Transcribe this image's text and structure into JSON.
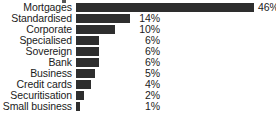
{
  "chart_data": {
    "type": "bar",
    "orientation": "horizontal",
    "title": "",
    "xlabel": "",
    "ylabel": "",
    "grid": false,
    "legend": null,
    "axis_visible": false,
    "value_suffix": "%",
    "xlim": [
      0,
      46
    ],
    "categories": [
      "Mortgages",
      "Standardised",
      "Corporate",
      "Specialised",
      "Sovereign",
      "Bank",
      "Business",
      "Credit cards",
      "Securitisation",
      "Small business"
    ],
    "values": [
      46,
      14,
      10,
      6,
      6,
      6,
      5,
      4,
      2,
      1
    ],
    "value_labels": [
      "46%",
      "14%",
      "10%",
      "6%",
      "6%",
      "6%",
      "5%",
      "4%",
      "2%",
      "1%"
    ],
    "bar_color": "#2e2e2e",
    "background_color": "#ffffff",
    "text_color": "#1b1b1b"
  },
  "rows": [
    {
      "label": "Mortgages",
      "value": 46,
      "value_label": "46%",
      "label_outside": true
    },
    {
      "label": "Standardised",
      "value": 14,
      "value_label": "14%",
      "label_outside": false
    },
    {
      "label": "Corporate",
      "value": 10,
      "value_label": "10%",
      "label_outside": false
    },
    {
      "label": "Specialised",
      "value": 6,
      "value_label": "6%",
      "label_outside": false
    },
    {
      "label": "Sovereign",
      "value": 6,
      "value_label": "6%",
      "label_outside": false
    },
    {
      "label": "Bank",
      "value": 6,
      "value_label": "6%",
      "label_outside": false
    },
    {
      "label": "Business",
      "value": 5,
      "value_label": "5%",
      "label_outside": false
    },
    {
      "label": "Credit cards",
      "value": 4,
      "value_label": "4%",
      "label_outside": false
    },
    {
      "label": "Securitisation",
      "value": 2,
      "value_label": "2%",
      "label_outside": false
    },
    {
      "label": "Small business",
      "value": 1,
      "value_label": "1%",
      "label_outside": false
    }
  ]
}
